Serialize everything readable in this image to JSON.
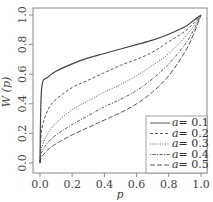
{
  "chart_data": {
    "type": "line",
    "title": "",
    "xlabel": "p",
    "ylabel": "W(p)",
    "xlim": [
      0,
      1
    ],
    "ylim": [
      0,
      1
    ],
    "xticks": [
      "0.0",
      "0.2",
      "0.4",
      "0.6",
      "0.8",
      "1.0"
    ],
    "yticks": [
      "0.0",
      "0.2",
      "0.4",
      "0.6",
      "0.8",
      "1.0"
    ],
    "grid": false,
    "legend_position": "bottom-right",
    "x": [
      0,
      0.01,
      0.05,
      0.1,
      0.2,
      0.3,
      0.4,
      0.5,
      0.6,
      0.7,
      0.8,
      0.9,
      0.95,
      1.0
    ],
    "series": [
      {
        "name": "a=0.1",
        "label": "a = 0.1",
        "dash": "solid",
        "values": [
          0.0,
          0.5,
          0.58,
          0.62,
          0.67,
          0.71,
          0.74,
          0.77,
          0.8,
          0.83,
          0.87,
          0.92,
          0.96,
          1.0
        ]
      },
      {
        "name": "a=0.2",
        "label": "a = 0.2",
        "dash": "dashed",
        "values": [
          0.0,
          0.22,
          0.36,
          0.43,
          0.51,
          0.56,
          0.61,
          0.66,
          0.7,
          0.75,
          0.82,
          0.89,
          0.94,
          1.0
        ]
      },
      {
        "name": "a=0.3",
        "label": "a = 0.3",
        "dash": "dotted",
        "values": [
          0.0,
          0.1,
          0.2,
          0.27,
          0.36,
          0.42,
          0.48,
          0.53,
          0.59,
          0.66,
          0.74,
          0.85,
          0.92,
          1.0
        ]
      },
      {
        "name": "a=0.4",
        "label": "a = 0.4",
        "dash": "dotdash",
        "values": [
          0.0,
          0.07,
          0.14,
          0.19,
          0.26,
          0.32,
          0.38,
          0.43,
          0.49,
          0.57,
          0.67,
          0.8,
          0.89,
          1.0
        ]
      },
      {
        "name": "a=0.5",
        "label": "a = 0.5",
        "dash": "longdash",
        "values": [
          0.0,
          0.04,
          0.09,
          0.13,
          0.19,
          0.24,
          0.29,
          0.34,
          0.4,
          0.48,
          0.59,
          0.75,
          0.86,
          1.0
        ]
      }
    ]
  },
  "legend": {
    "items": [
      {
        "prefix": "a",
        "value": "= 0.1"
      },
      {
        "prefix": "a",
        "value": "= 0.2"
      },
      {
        "prefix": "a",
        "value": "= 0.3"
      },
      {
        "prefix": "a",
        "value": "= 0.4"
      },
      {
        "prefix": "a",
        "value": "= 0.5"
      }
    ]
  },
  "axes": {
    "xlabel": "p",
    "ylabel": "W (p)"
  }
}
